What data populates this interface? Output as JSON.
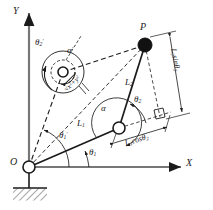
{
  "figure": {
    "type": "kinematics-diagram",
    "stroke_color": "#1b1b1b",
    "background_color": "#ffffff",
    "joint_fill": "#ffffff",
    "endpoint_fill": "#111111"
  },
  "axes": {
    "x_label": "X",
    "y_label": "Y",
    "origin_label": "O"
  },
  "points": {
    "origin": "O",
    "endpoint": "P"
  },
  "links": {
    "link1_label": "L",
    "link1_sub": "1",
    "link2_label": "L",
    "link2_sub": "2"
  },
  "angles": {
    "theta1": {
      "base": "θ",
      "sub": "1",
      "prime": ""
    },
    "theta2": {
      "base": "θ",
      "sub": "2",
      "prime": ""
    },
    "theta1_prime": {
      "base": "θ",
      "sub": "1",
      "prime": "′"
    },
    "theta2_prime": {
      "base": "θ",
      "sub": "2",
      "prime": "′"
    },
    "alpha": {
      "base": "α",
      "prime": ""
    },
    "alpha_prime": {
      "base": "α",
      "prime": "′"
    }
  },
  "dimensions": {
    "vertical": {
      "text": "L",
      "sub": "2",
      "fn": "sinθ",
      "fn_sub": "2"
    },
    "horizontal": {
      "text": "L",
      "sub": "2",
      "fn": "cosθ",
      "fn_sub": "2"
    },
    "radial": {
      "text": "√",
      "expr": "x",
      "expr_sup": "2",
      "expr2": "+y",
      "expr2_sup": "2"
    }
  },
  "markers": {
    "right_angle": "right-angle-square",
    "ground": "fixed-ground-hatching"
  }
}
